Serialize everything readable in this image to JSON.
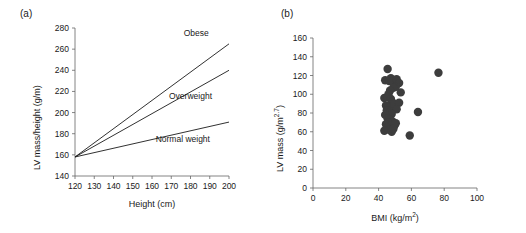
{
  "figure": {
    "panels": [
      {
        "tag": "(a)",
        "type": "line",
        "xlabel": "Height (cm)",
        "ylabel": "LV mass/height (g/m)",
        "xlim": [
          120,
          200
        ],
        "ylim": [
          140,
          280
        ],
        "xticks": [
          120,
          130,
          140,
          150,
          160,
          170,
          180,
          190,
          200
        ],
        "yticks": [
          140,
          160,
          180,
          200,
          220,
          240,
          260,
          280
        ],
        "grid": false,
        "legend_position": "inline-right",
        "series": [
          {
            "name": "Obese",
            "label": "Obese",
            "color": "#1a1a1a",
            "x": [
              120,
              200
            ],
            "values": [
              158,
              265
            ],
            "label_x": 183,
            "label_y": 272
          },
          {
            "name": "Overweight",
            "label": "Overweight",
            "color": "#1a1a1a",
            "x": [
              120,
              200
            ],
            "values": [
              158,
              240
            ],
            "label_x": 180,
            "label_y": 213
          },
          {
            "name": "Normal weight",
            "label": "Normal weight",
            "color": "#1a1a1a",
            "x": [
              120,
              200
            ],
            "values": [
              158,
              191
            ],
            "label_x": 176,
            "label_y": 172
          }
        ]
      },
      {
        "tag": "(b)",
        "type": "scatter",
        "xlabel_main": "BMI (kg/m",
        "xlabel_sup": "2",
        "xlabel_tail": ")",
        "xlabel": "BMI (kg/m2)",
        "ylabel_main": "LV mass (g/m",
        "ylabel_sup": "2.7",
        "ylabel_tail": ")",
        "ylabel": "LV mass (g/m2.7)",
        "xlim": [
          0,
          100
        ],
        "ylim": [
          0,
          160
        ],
        "xticks": [
          0,
          20,
          40,
          60,
          80,
          100
        ],
        "yticks": [
          0,
          20,
          40,
          60,
          80,
          100,
          120,
          140,
          160
        ],
        "grid": false,
        "marker_color": "#3d3d3d",
        "marker_size": 4.2,
        "points": [
          [
            45.5,
            127
          ],
          [
            44.0,
            115
          ],
          [
            46.5,
            114
          ],
          [
            47.5,
            117
          ],
          [
            48.5,
            114
          ],
          [
            51.0,
            116
          ],
          [
            51.5,
            113
          ],
          [
            52.5,
            112
          ],
          [
            50.5,
            108
          ],
          [
            49.0,
            107
          ],
          [
            47.0,
            104
          ],
          [
            46.0,
            100
          ],
          [
            43.5,
            96
          ],
          [
            45.5,
            97
          ],
          [
            53.5,
            102
          ],
          [
            47.5,
            95
          ],
          [
            48.0,
            92
          ],
          [
            44.5,
            88
          ],
          [
            46.0,
            87
          ],
          [
            47.0,
            86
          ],
          [
            49.5,
            90
          ],
          [
            52.5,
            91
          ],
          [
            51.0,
            84
          ],
          [
            45.0,
            83
          ],
          [
            46.5,
            80
          ],
          [
            48.0,
            79
          ],
          [
            44.0,
            78
          ],
          [
            45.5,
            74
          ],
          [
            47.0,
            73
          ],
          [
            48.5,
            71
          ],
          [
            46.0,
            70
          ],
          [
            44.5,
            68
          ],
          [
            47.5,
            67
          ],
          [
            49.5,
            66
          ],
          [
            50.5,
            69
          ],
          [
            45.0,
            64
          ],
          [
            46.5,
            62
          ],
          [
            43.5,
            61
          ],
          [
            48.0,
            60
          ],
          [
            49.0,
            63
          ],
          [
            59.0,
            56
          ],
          [
            64.0,
            81
          ],
          [
            76.5,
            123
          ]
        ]
      }
    ]
  }
}
